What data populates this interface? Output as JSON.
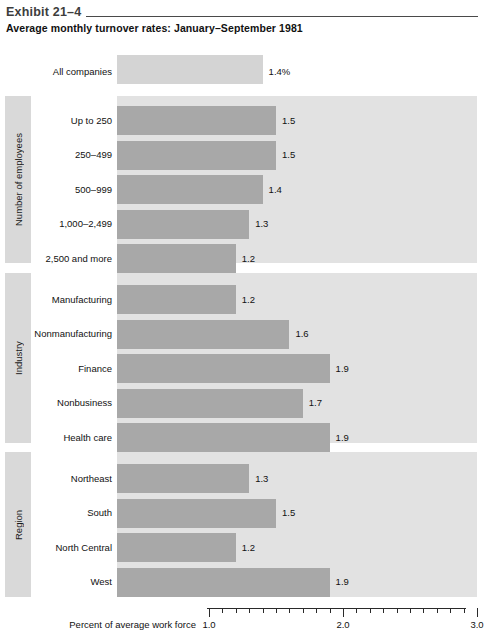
{
  "header": {
    "exhibit_label": "Exhibit 21–4",
    "title": "Average monthly turnover rates: January–September 1981"
  },
  "axis": {
    "caption": "Percent of average work force",
    "tick_labels": [
      "1.0",
      "2.0",
      "3.0"
    ],
    "major_ticks": [
      1.0,
      2.0,
      3.0
    ],
    "minor_ticks": [
      1.1,
      1.2,
      1.3,
      1.4,
      1.5,
      1.6,
      1.7,
      1.8,
      1.9,
      2.1,
      2.2,
      2.3,
      2.4,
      2.5,
      2.6,
      2.7,
      2.8,
      2.9
    ],
    "min": 1.0,
    "max": 3.0
  },
  "overall": {
    "label": "All companies",
    "value": 1.4,
    "value_text": "1.4%"
  },
  "sections": [
    {
      "band_label": "Number of employees",
      "rows": [
        {
          "label": "Up to 250",
          "value": 1.5,
          "value_text": "1.5"
        },
        {
          "label": "250–499",
          "value": 1.5,
          "value_text": "1.5"
        },
        {
          "label": "500–999",
          "value": 1.4,
          "value_text": "1.4"
        },
        {
          "label": "1,000–2,499",
          "value": 1.3,
          "value_text": "1.3"
        },
        {
          "label": "2,500 and more",
          "value": 1.2,
          "value_text": "1.2"
        }
      ]
    },
    {
      "band_label": "Industry",
      "rows": [
        {
          "label": "Manufacturing",
          "value": 1.2,
          "value_text": "1.2"
        },
        {
          "label": "Nonmanufacturing",
          "value": 1.6,
          "value_text": "1.6"
        },
        {
          "label": "Finance",
          "value": 1.9,
          "value_text": "1.9"
        },
        {
          "label": "Nonbusiness",
          "value": 1.7,
          "value_text": "1.7"
        },
        {
          "label": "Health care",
          "value": 1.9,
          "value_text": "1.9"
        }
      ]
    },
    {
      "band_label": "Region",
      "rows": [
        {
          "label": "Northeast",
          "value": 1.3,
          "value_text": "1.3"
        },
        {
          "label": "South",
          "value": 1.5,
          "value_text": "1.5"
        },
        {
          "label": "North Central",
          "value": 1.2,
          "value_text": "1.2"
        },
        {
          "label": "West",
          "value": 1.9,
          "value_text": "1.9"
        }
      ]
    }
  ],
  "colors": {
    "bar_fill": "#a8a8a8",
    "overall_bar_fill": "#d4d4d4",
    "panel_background": "#e2e2e2",
    "sideband_background": "#d9d9d9",
    "page_background": "#ffffff",
    "text": "#111111",
    "rule": "#4a4a4a"
  },
  "chart_data": {
    "type": "bar",
    "orientation": "horizontal",
    "title": "Average monthly turnover rates: January–September 1981",
    "xlabel": "Percent of average work force",
    "ylabel": "",
    "xlim": [
      0,
      3.0
    ],
    "axis_displayed_range": [
      1.0,
      3.0
    ],
    "grid": false,
    "legend": "none",
    "categories": [
      "All companies",
      "Up to 250",
      "250–499",
      "500–999",
      "1,000–2,499",
      "2,500 and more",
      "Manufacturing",
      "Nonmanufacturing",
      "Finance",
      "Nonbusiness",
      "Health care",
      "Northeast",
      "South",
      "North Central",
      "West"
    ],
    "values": [
      1.4,
      1.5,
      1.5,
      1.4,
      1.3,
      1.2,
      1.2,
      1.6,
      1.9,
      1.7,
      1.9,
      1.3,
      1.5,
      1.2,
      1.9
    ],
    "groups": [
      {
        "name": "",
        "categories": [
          "All companies"
        ],
        "values": [
          1.4
        ]
      },
      {
        "name": "Number of employees",
        "categories": [
          "Up to 250",
          "250–499",
          "500–999",
          "1,000–2,499",
          "2,500 and more"
        ],
        "values": [
          1.5,
          1.5,
          1.4,
          1.3,
          1.2
        ]
      },
      {
        "name": "Industry",
        "categories": [
          "Manufacturing",
          "Nonmanufacturing",
          "Finance",
          "Nonbusiness",
          "Health care"
        ],
        "values": [
          1.2,
          1.6,
          1.9,
          1.7,
          1.9
        ]
      },
      {
        "name": "Region",
        "categories": [
          "Northeast",
          "South",
          "North Central",
          "West"
        ],
        "values": [
          1.3,
          1.5,
          1.2,
          1.9
        ]
      }
    ]
  }
}
